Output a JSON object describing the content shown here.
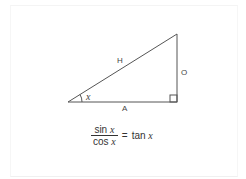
{
  "diagram": {
    "labels": {
      "hypotenuse": "H",
      "opposite": "O",
      "adjacent": "A",
      "angle": "x"
    },
    "equation": {
      "numerator_fn": "sin",
      "numerator_var": "x",
      "denominator_fn": "cos",
      "denominator_var": "x",
      "equals": "=",
      "result_fn": "tan",
      "result_var": "x"
    },
    "colors": {
      "line": "#444444",
      "text": "#333333"
    }
  }
}
